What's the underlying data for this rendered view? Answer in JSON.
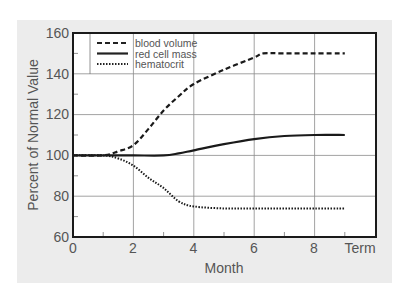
{
  "chart_data": {
    "type": "line",
    "title": "",
    "xlabel": "Month",
    "ylabel": "Percent of Normal Value",
    "xlim": [
      0,
      9.0
    ],
    "ylim": [
      60,
      160
    ],
    "x_ticks": [
      "0",
      "2",
      "4",
      "6",
      "8",
      "Term"
    ],
    "x_tick_values": [
      0,
      2,
      4,
      6,
      8,
      9
    ],
    "y_ticks": [
      "60",
      "80",
      "100",
      "120",
      "140",
      "160"
    ],
    "grid": true,
    "legend_position": "upper-left",
    "series": [
      {
        "name": "blood volume",
        "style": "dashed",
        "x": [
          0,
          1,
          1.5,
          2,
          2.5,
          3,
          3.5,
          4,
          5,
          6,
          6.3,
          7,
          8,
          9
        ],
        "values": [
          100,
          100,
          102,
          105,
          113,
          122,
          129,
          135,
          142,
          148,
          150,
          150,
          150,
          150
        ]
      },
      {
        "name": "red cell mass",
        "style": "solid",
        "x": [
          0,
          1,
          2,
          3,
          3.5,
          4,
          5,
          6,
          7,
          8,
          9
        ],
        "values": [
          100,
          100,
          100,
          100,
          101,
          102.5,
          105.5,
          108,
          109.5,
          110,
          110
        ]
      },
      {
        "name": "hematocrit",
        "style": "dotted",
        "x": [
          0,
          1,
          1.5,
          2,
          2.5,
          3,
          3.5,
          4,
          5,
          6,
          7,
          8,
          9
        ],
        "values": [
          100,
          100,
          98.5,
          95,
          89,
          84,
          77.5,
          75,
          74,
          74,
          74,
          74,
          74
        ]
      }
    ]
  },
  "labels": {
    "xlabel": "Month",
    "ylabel": "Percent of Normal Value",
    "x_ticks": [
      "0",
      "2",
      "4",
      "6",
      "8",
      "Term"
    ],
    "y_ticks": [
      "160",
      "140",
      "120",
      "100",
      "80",
      "60"
    ],
    "legend": [
      "blood volume",
      "red cell mass",
      "hematocrit"
    ]
  }
}
